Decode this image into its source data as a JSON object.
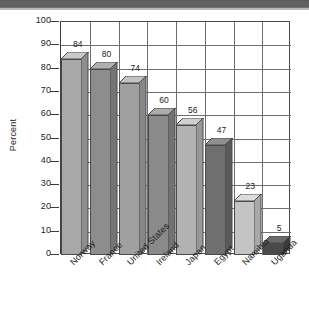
{
  "chart_data": {
    "type": "bar",
    "title": "",
    "xlabel": "",
    "ylabel": "Percent",
    "ylim": [
      0,
      100
    ],
    "ytick_step": 10,
    "grid": true,
    "legend": "none",
    "style": "3d-column",
    "categories": [
      "Norway",
      "France",
      "United States",
      "Ireland",
      "Japan",
      "Egypt",
      "Namibia",
      "Uganda"
    ],
    "values": [
      84,
      80,
      74,
      60,
      56,
      47,
      23,
      5
    ],
    "value_labels": [
      "84",
      "80",
      "74",
      "60",
      "56",
      "47",
      "23",
      "5"
    ],
    "ytick_labels": [
      "100",
      "90",
      "80",
      "70",
      "60",
      "50",
      "40",
      "30",
      "20",
      "10",
      "0"
    ],
    "bar_colors": [
      "#a8a8a8",
      "#8d8d8d",
      "#a0a0a0",
      "#8a8a8a",
      "#b2b2b2",
      "#6f6f6f",
      "#c4c4c4",
      "#4a4a4a"
    ],
    "bar_top_colors": [
      "#c9c9c9",
      "#b0b0b0",
      "#c2c2c2",
      "#ababab",
      "#d0d0d0",
      "#909090",
      "#dcdcdc",
      "#6a6a6a"
    ],
    "bar_side_colors": [
      "#8e8e8e",
      "#757575",
      "#878787",
      "#727272",
      "#989898",
      "#5a5a5a",
      "#a8a8a8",
      "#3a3a3a"
    ],
    "axis_color": "#4a4a4a",
    "grid_color": "#6e6e6e",
    "text_color": "#1d1d1d",
    "background": "#ffffff"
  }
}
